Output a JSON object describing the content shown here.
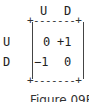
{
  "matrix": {
    "col_headers": [
      "U",
      "D"
    ],
    "row_headers": [
      "U",
      "D"
    ],
    "cells": [
      [
        "0",
        "+1"
      ],
      [
        "−1",
        "0"
      ]
    ],
    "top_border": "+-------+",
    "bottom_border": "+-------+"
  },
  "caption": "Figure 09B"
}
